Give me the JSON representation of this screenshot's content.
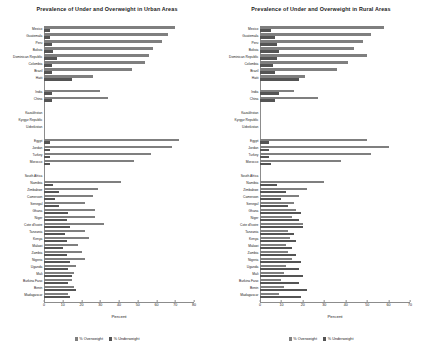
{
  "charts": [
    {
      "key": "urban",
      "title": "Prevalence of Under and Overweight in Urban Areas",
      "xlabel": "Percent",
      "legend": [
        {
          "label": "% Overweight",
          "color": "#7f7f7f"
        },
        {
          "label": "% Underweight",
          "color": "#545454"
        }
      ],
      "ticks": [
        "0",
        "10",
        "20",
        "30",
        "40",
        "50",
        "60",
        "70",
        "80"
      ]
    },
    {
      "key": "rural",
      "title": "Prevalence of Under and Overweight in Rural Areas",
      "xlabel": "Percent",
      "legend": [
        {
          "label": "% Overweight",
          "color": "#7f7f7f"
        },
        {
          "label": "% Underweight",
          "color": "#545454"
        }
      ],
      "ticks": [
        "0",
        "10",
        "20",
        "30",
        "40",
        "50",
        "60",
        "70"
      ]
    }
  ],
  "chart_data": [
    {
      "type": "bar",
      "orientation": "horizontal",
      "title": "Prevalence of Under and Overweight in Urban Areas",
      "xlabel": "Percent",
      "ylabel": "",
      "xlim": [
        0,
        80
      ],
      "xticks": [
        0,
        10,
        20,
        30,
        40,
        50,
        60,
        70,
        80
      ],
      "grid": false,
      "legend_position": "bottom",
      "series": [
        {
          "name": "% Overweight",
          "color": "#7f7f7f"
        },
        {
          "name": "% Underweight",
          "color": "#545454"
        }
      ],
      "categories": [
        "Mexico",
        "Guatemala",
        "Peru",
        "Bolivia",
        "Dominican Republic",
        "Colombia",
        "Brazil",
        "Haiti",
        "India",
        "China",
        "Kazakhstan",
        "Kyrgyz Republic",
        "Uzbekistan",
        "Egypt",
        "Jordan",
        "Turkey",
        "Morocco",
        "South Africa",
        "Namibia",
        "Zimbabwe",
        "Cameroon",
        "Senegal",
        "Ghana",
        "Niger",
        "Cote d'Ivoire",
        "Tanzania",
        "Kenya",
        "Malawi",
        "Zambia",
        "Nigeria",
        "Uganda",
        "Mali",
        "Burkina Faso",
        "Benin",
        "Madagascar"
      ],
      "group_breaks_after": [
        "Haiti",
        "China",
        "Uzbekistan",
        "Morocco"
      ],
      "values": {
        "% Overweight": [
          70,
          66,
          63,
          58,
          56,
          54,
          47,
          26,
          30,
          34,
          null,
          null,
          null,
          72,
          68,
          57,
          48,
          null,
          41,
          29,
          26,
          22,
          27,
          27,
          32,
          22,
          24,
          18,
          20,
          22,
          17,
          16,
          15,
          16,
          13,
          18,
          12
        ],
        "% Underweight": [
          3,
          3,
          4,
          5,
          7,
          4,
          4,
          15,
          4,
          4,
          null,
          null,
          null,
          3,
          3,
          3,
          3,
          null,
          5,
          8,
          6,
          8,
          13,
          12,
          14,
          11,
          12,
          10,
          12,
          14,
          13,
          15,
          13,
          17,
          14,
          20,
          12
        ]
      },
      "note": "Bars are grouped by region with blank spacer rows between groups; each category shows a lighter '% Overweight' bar above a darker '% Underweight' bar."
    },
    {
      "type": "bar",
      "orientation": "horizontal",
      "title": "Prevalence of Under and Overweight in Rural Areas",
      "xlabel": "Percent",
      "ylabel": "",
      "xlim": [
        0,
        70
      ],
      "xticks": [
        0,
        10,
        20,
        30,
        40,
        50,
        60,
        70
      ],
      "grid": false,
      "legend_position": "bottom",
      "series": [
        {
          "name": "% Overweight",
          "color": "#7f7f7f"
        },
        {
          "name": "% Underweight",
          "color": "#545454"
        }
      ],
      "categories": [
        "Mexico",
        "Guatemala",
        "Peru",
        "Bolivia",
        "Dominican Republic",
        "Colombia",
        "Brazil",
        "Haiti",
        "India",
        "China",
        "Kazakhstan",
        "Kyrgyz Republic",
        "Uzbekistan",
        "Egypt",
        "Jordan",
        "Turkey",
        "Morocco",
        "South Africa",
        "Namibia",
        "Zimbabwe",
        "Cameroon",
        "Senegal",
        "Ghana",
        "Niger",
        "Cote d'Ivoire",
        "Tanzania",
        "Kenya",
        "Malawi",
        "Zambia",
        "Nigeria",
        "Uganda",
        "Mali",
        "Burkina Faso",
        "Benin",
        "Madagascar"
      ],
      "group_breaks_after": [
        "Haiti",
        "China",
        "Uzbekistan",
        "Morocco"
      ],
      "values": {
        "% Overweight": [
          58,
          52,
          48,
          44,
          50,
          41,
          36,
          21,
          16,
          27,
          null,
          null,
          null,
          50,
          60,
          52,
          38,
          null,
          30,
          22,
          18,
          16,
          17,
          15,
          20,
          13,
          14,
          12,
          13,
          15,
          12,
          11,
          10,
          11,
          9,
          15,
          10
        ],
        "% Underweight": [
          5,
          7,
          8,
          9,
          8,
          6,
          7,
          18,
          9,
          7,
          null,
          null,
          null,
          4,
          4,
          4,
          5,
          null,
          8,
          12,
          10,
          13,
          19,
          18,
          20,
          16,
          17,
          15,
          17,
          19,
          18,
          20,
          18,
          22,
          19,
          24,
          16
        ]
      },
      "note": "Same country ordering as the urban panel; underweight bars are proportionally longer and overweight bars shorter than in urban areas."
    }
  ]
}
